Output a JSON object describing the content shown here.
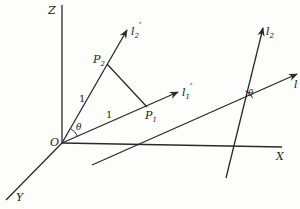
{
  "figure": {
    "axes": {
      "x_label": "X",
      "y_label": "Y",
      "z_label": "Z",
      "origin_label": "O"
    },
    "vectors": {
      "l1_prime": {
        "base": "l",
        "sub": "1",
        "prime": "′"
      },
      "l2_prime": {
        "base": "l",
        "sub": "2",
        "prime": "′"
      },
      "l2": {
        "base": "l",
        "sub": "2"
      },
      "l": {
        "base": "l"
      }
    },
    "points": {
      "p1": {
        "base": "P",
        "sub": "1"
      },
      "p2": {
        "base": "P",
        "sub": "2"
      }
    },
    "segment_labels": {
      "op2_length": "1",
      "op1_length": "1"
    },
    "angles": {
      "at_origin": "θ",
      "at_intersection": "θ"
    },
    "colors": {
      "ink": "#2a2a2a",
      "paper": "#fdfdfc"
    }
  }
}
